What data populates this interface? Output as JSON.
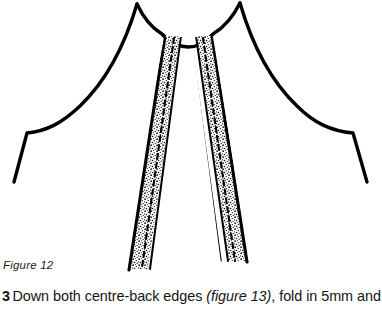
{
  "figure": {
    "caption": "Figure 12",
    "illustration_name": "garment-centre-back-edges-diagram",
    "colors": {
      "ink": "#000000",
      "background": "#ffffff",
      "stipple": "#000000"
    },
    "parts": {
      "neckline": "neckline-curve",
      "left_sleeve": "left-sleeve-outline",
      "right_sleeve": "right-sleeve-outline",
      "left_band": "left-centre-back-band",
      "right_band": "right-centre-back-band",
      "left_stitch_line": "left-dashed-stitch-line",
      "right_stitch_line": "right-dashed-stitch-line"
    }
  },
  "instruction": {
    "number": "3",
    "text_before": "Down both centre-back edges ",
    "figure_reference": "(figure 13)",
    "text_after": ", fold in 5mm and"
  }
}
